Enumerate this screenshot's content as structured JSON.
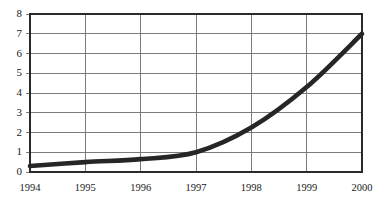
{
  "chart_data": {
    "type": "line",
    "title": "",
    "subtitle": "",
    "xlabel": "",
    "ylabel": "",
    "categories": [
      "1994",
      "1995",
      "1996",
      "1997",
      "1998",
      "1999",
      "2000"
    ],
    "x": [
      1994,
      1995,
      1996,
      1997,
      1998,
      1999,
      2000
    ],
    "series": [
      {
        "name": "",
        "values": [
          0.3,
          0.5,
          0.65,
          1.0,
          2.25,
          4.3,
          7.0
        ],
        "color": "#262626"
      }
    ],
    "values": [
      0.3,
      0.5,
      0.65,
      1.0,
      2.25,
      4.3,
      7.0
    ],
    "ylim": [
      0,
      8
    ],
    "xlim": [
      1994,
      2000
    ],
    "yticks": [
      0,
      1,
      2,
      3,
      4,
      5,
      6,
      7,
      8
    ],
    "ytick_labels": [
      "0",
      "1",
      "2",
      "3",
      "4",
      "5",
      "6",
      "7",
      "8"
    ],
    "xticks": [
      1994,
      1995,
      1996,
      1997,
      1998,
      1999,
      2000
    ],
    "xtick_labels": [
      "1994",
      "1995",
      "1996",
      "1997",
      "1998",
      "1999",
      "2000"
    ],
    "grid": true,
    "grid_color": "#6e6e6e",
    "legend": false,
    "legend_position": "none",
    "annotations": [],
    "background_color": "#ffffff",
    "frame_color": "#2a2a2a"
  },
  "plot": {
    "left": 30,
    "right": 362,
    "top": 14,
    "bottom": 172
  }
}
